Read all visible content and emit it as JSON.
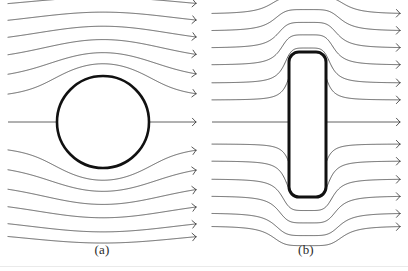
{
  "figure": {
    "title": "",
    "background_color": "#ffffff",
    "line_color": "#3a3a3a",
    "body_color": "#111111",
    "width": 408,
    "height": 271
  },
  "labels": {
    "panel_a": "(a)",
    "panel_b": "(b)"
  },
  "chart_data": {
    "type": "line",
    "xlabel": "",
    "ylabel": "",
    "grid": false,
    "legend": null,
    "panels": [
      {
        "id": "a",
        "label": "(a)",
        "obstacle": {
          "shape": "circle",
          "center_x": 103,
          "center_y": 122,
          "radius": 46,
          "stroke_width": 2.6
        },
        "domain": {
          "x": [
            8,
            196
          ],
          "y": [
            8,
            232
          ]
        },
        "centerline_y": 122,
        "streamline_count": 13,
        "inlet_y": [
          14,
          31,
          48,
          65,
          83,
          100,
          122,
          144,
          161,
          179,
          196,
          213,
          226
        ],
        "arrow_head": "open-chevron",
        "arrow_x": 190
      },
      {
        "id": "b",
        "label": "(b)",
        "obstacle": {
          "shape": "rounded-rectangle",
          "x": 289,
          "y": 52,
          "width": 37,
          "height": 145,
          "corner_radius": 10,
          "stroke_width": 3.0
        },
        "domain": {
          "x": [
            212,
            400
          ],
          "y": [
            8,
            232
          ]
        },
        "centerline_y": 122,
        "streamline_count": 13,
        "inlet_y": [
          14,
          31,
          48,
          65,
          83,
          100,
          122,
          144,
          161,
          179,
          196,
          213,
          226
        ],
        "arrow_head": "open-chevron",
        "arrow_x": 394
      }
    ]
  }
}
